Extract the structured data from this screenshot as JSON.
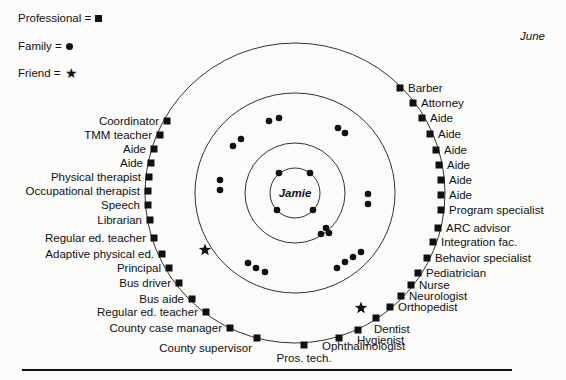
{
  "title": "June",
  "center_label": "Jamie",
  "legend": [
    {
      "label": "Professional =",
      "symbol": "square"
    },
    {
      "label": "Family =",
      "symbol": "circle"
    },
    {
      "label": "Friend =",
      "symbol": "star"
    }
  ],
  "colors": {
    "ink": "#111111",
    "background": "#fbfbfa",
    "ring": "#333333"
  },
  "rings": {
    "center": [
      295,
      193
    ],
    "radii": [
      25,
      50,
      100,
      150
    ]
  },
  "professionals": [
    {
      "label": "Coordinator",
      "x": 167,
      "y": 121,
      "side": "left"
    },
    {
      "label": "TMM teacher",
      "x": 160,
      "y": 135,
      "side": "left"
    },
    {
      "label": "Aide",
      "x": 154,
      "y": 149,
      "side": "left"
    },
    {
      "label": "Aide",
      "x": 151,
      "y": 163,
      "side": "left"
    },
    {
      "label": "Physical therapist",
      "x": 149,
      "y": 177,
      "side": "left"
    },
    {
      "label": "Occupational therapist",
      "x": 148,
      "y": 191,
      "side": "left"
    },
    {
      "label": "Speech",
      "x": 148,
      "y": 205,
      "side": "left"
    },
    {
      "label": "Librarian",
      "x": 150,
      "y": 220,
      "side": "left"
    },
    {
      "label": "Regular ed. teacher",
      "x": 154,
      "y": 238,
      "side": "left"
    },
    {
      "label": "Adaptive physical ed.",
      "x": 162,
      "y": 254,
      "side": "left"
    },
    {
      "label": "Principal",
      "x": 169,
      "y": 268,
      "side": "left"
    },
    {
      "label": "Bus driver",
      "x": 179,
      "y": 283,
      "side": "left"
    },
    {
      "label": "Bus aide",
      "x": 192,
      "y": 299,
      "side": "left"
    },
    {
      "label": "Regular ed. teacher",
      "x": 206,
      "y": 312,
      "side": "left"
    },
    {
      "label": "County case manager",
      "x": 230,
      "y": 328,
      "side": "left"
    },
    {
      "label": "County supervisor",
      "x": 257,
      "y": 338,
      "side": "left-below"
    },
    {
      "label": "Pros. tech.",
      "x": 304,
      "y": 345,
      "side": "below"
    },
    {
      "label": "Ophthalmologist",
      "x": 339,
      "y": 338,
      "side": "right-below"
    },
    {
      "label": "Hygienist",
      "x": 358,
      "y": 330,
      "side": "right-below"
    },
    {
      "label": "Dentist",
      "x": 376,
      "y": 318,
      "side": "right-below"
    },
    {
      "label": "Orthopedist",
      "x": 390,
      "y": 307,
      "side": "right"
    },
    {
      "label": "Neurologist",
      "x": 401,
      "y": 296,
      "side": "right"
    },
    {
      "label": "Nurse",
      "x": 411,
      "y": 285,
      "side": "right"
    },
    {
      "label": "Pediatrician",
      "x": 418,
      "y": 273,
      "side": "right"
    },
    {
      "label": "Behavior specialist",
      "x": 427,
      "y": 258,
      "side": "right"
    },
    {
      "label": "Integration fac.",
      "x": 433,
      "y": 242,
      "side": "right"
    },
    {
      "label": "ARC advisor",
      "x": 438,
      "y": 228,
      "side": "right"
    },
    {
      "label": "Program specialist",
      "x": 441,
      "y": 210,
      "side": "right"
    },
    {
      "label": "Aide",
      "x": 441,
      "y": 195,
      "side": "right"
    },
    {
      "label": "Aide",
      "x": 441,
      "y": 180,
      "side": "right"
    },
    {
      "label": "Aide",
      "x": 439,
      "y": 165,
      "side": "right"
    },
    {
      "label": "Aide",
      "x": 436,
      "y": 150,
      "side": "right"
    },
    {
      "label": "Aide",
      "x": 430,
      "y": 134,
      "side": "right"
    },
    {
      "label": "Aide",
      "x": 422,
      "y": 118,
      "side": "right"
    },
    {
      "label": "Attorney",
      "x": 413,
      "y": 103,
      "side": "right"
    },
    {
      "label": "Barber",
      "x": 400,
      "y": 88,
      "side": "right"
    }
  ],
  "family": [
    [
      279,
      173
    ],
    [
      310,
      173
    ],
    [
      277,
      210
    ],
    [
      313,
      210
    ],
    [
      326,
      228
    ],
    [
      329,
      233
    ],
    [
      321,
      234
    ],
    [
      269,
      121
    ],
    [
      279,
      118
    ],
    [
      338,
      128
    ],
    [
      345,
      133
    ],
    [
      233,
      146
    ],
    [
      241,
      139
    ],
    [
      220,
      180
    ],
    [
      220,
      190
    ],
    [
      368,
      194
    ],
    [
      368,
      204
    ],
    [
      248,
      263
    ],
    [
      256,
      268
    ],
    [
      265,
      272
    ],
    [
      337,
      268
    ],
    [
      345,
      262
    ],
    [
      353,
      257
    ],
    [
      361,
      252
    ]
  ],
  "friends": [
    [
      205,
      250
    ],
    [
      361,
      308
    ]
  ]
}
